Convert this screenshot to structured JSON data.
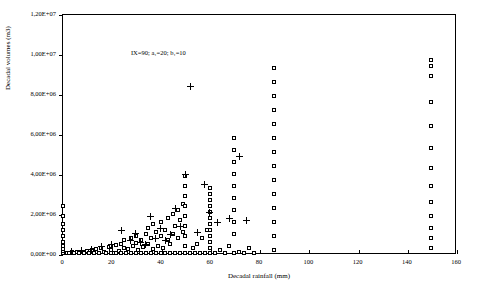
{
  "chart_data": {
    "type": "scatter",
    "title": "",
    "annotation": "IX=90; a₁=20; b₁=10",
    "xlabel": "Decadal rainfall (mm)",
    "ylabel": "Decadal volumes (m3)",
    "xlim": [
      0,
      160
    ],
    "ylim": [
      0,
      12000000
    ],
    "xticks": [
      0,
      20,
      40,
      60,
      80,
      100,
      120,
      140,
      160
    ],
    "xticklabels": [
      "0",
      "20",
      "40",
      "60",
      "80",
      "100",
      "120",
      "140",
      "160"
    ],
    "yticks": [
      0,
      2000000,
      4000000,
      6000000,
      8000000,
      10000000,
      12000000
    ],
    "yticklabels": [
      "0,00E+00",
      "2,00E+06",
      "4,00E+06",
      "6,00E+06",
      "8,00E+06",
      "1,00E+07",
      "1,20E+07"
    ],
    "grid": false,
    "legend": "none",
    "series": [
      {
        "name": "squares",
        "marker": "open-square",
        "points": [
          [
            0.5,
            60000
          ],
          [
            0.5,
            150000
          ],
          [
            0.5,
            250000
          ],
          [
            0.5,
            400000
          ],
          [
            0.5,
            600000
          ],
          [
            0.5,
            900000
          ],
          [
            0.5,
            1200000
          ],
          [
            0.5,
            1500000
          ],
          [
            0.5,
            1900000
          ],
          [
            0.5,
            2400000
          ],
          [
            2,
            60000
          ],
          [
            3,
            60000
          ],
          [
            4,
            80000
          ],
          [
            5,
            60000
          ],
          [
            6,
            100000
          ],
          [
            7,
            60000
          ],
          [
            8,
            120000
          ],
          [
            9,
            60000
          ],
          [
            10,
            150000
          ],
          [
            11,
            60000
          ],
          [
            12,
            200000
          ],
          [
            13,
            60000
          ],
          [
            14,
            240000
          ],
          [
            15,
            60000
          ],
          [
            16,
            300000
          ],
          [
            17,
            100000
          ],
          [
            18,
            60000
          ],
          [
            19,
            350000
          ],
          [
            20,
            60000
          ],
          [
            20,
            200000
          ],
          [
            20,
            400000
          ],
          [
            21,
            60000
          ],
          [
            22,
            450000
          ],
          [
            22,
            60000
          ],
          [
            23,
            150000
          ],
          [
            24,
            500000
          ],
          [
            24,
            60000
          ],
          [
            25,
            300000
          ],
          [
            25,
            700000
          ],
          [
            26,
            60000
          ],
          [
            27,
            250000
          ],
          [
            28,
            60000
          ],
          [
            28,
            800000
          ],
          [
            29,
            400000
          ],
          [
            30,
            60000
          ],
          [
            30,
            550000
          ],
          [
            30,
            900000
          ],
          [
            31,
            200000
          ],
          [
            32,
            60000
          ],
          [
            32,
            700000
          ],
          [
            33,
            350000
          ],
          [
            34,
            60000
          ],
          [
            34,
            1000000
          ],
          [
            35,
            500000
          ],
          [
            35,
            1300000
          ],
          [
            36,
            60000
          ],
          [
            36,
            800000
          ],
          [
            37,
            250000
          ],
          [
            37,
            1500000
          ],
          [
            38,
            60000
          ],
          [
            38,
            1100000
          ],
          [
            39,
            400000
          ],
          [
            40,
            60000
          ],
          [
            40,
            900000
          ],
          [
            40,
            1600000
          ],
          [
            41,
            300000
          ],
          [
            42,
            60000
          ],
          [
            42,
            1200000
          ],
          [
            43,
            700000
          ],
          [
            43,
            1800000
          ],
          [
            44,
            60000
          ],
          [
            44,
            500000
          ],
          [
            45,
            1000000
          ],
          [
            45,
            2000000
          ],
          [
            46,
            60000
          ],
          [
            46,
            1400000
          ],
          [
            47,
            800000
          ],
          [
            47,
            2200000
          ],
          [
            48,
            60000
          ],
          [
            48,
            1700000
          ],
          [
            49,
            1100000
          ],
          [
            49,
            2500000
          ],
          [
            50,
            60000
          ],
          [
            50,
            400000
          ],
          [
            50,
            900000
          ],
          [
            50,
            1400000
          ],
          [
            50,
            1900000
          ],
          [
            50,
            2400000
          ],
          [
            50,
            2900000
          ],
          [
            50,
            3400000
          ],
          [
            50,
            3900000
          ],
          [
            52,
            60000
          ],
          [
            53,
            300000
          ],
          [
            54,
            60000
          ],
          [
            55,
            500000
          ],
          [
            56,
            60000
          ],
          [
            57,
            800000
          ],
          [
            58,
            60000
          ],
          [
            59,
            1200000
          ],
          [
            60,
            60000
          ],
          [
            60,
            300000
          ],
          [
            60,
            600000
          ],
          [
            60,
            900000
          ],
          [
            60,
            1200000
          ],
          [
            60,
            1500000
          ],
          [
            60,
            1800000
          ],
          [
            60,
            2100000
          ],
          [
            60,
            2400000
          ],
          [
            60,
            2700000
          ],
          [
            60,
            3000000
          ],
          [
            60,
            3300000
          ],
          [
            62,
            60000
          ],
          [
            64,
            200000
          ],
          [
            66,
            60000
          ],
          [
            68,
            400000
          ],
          [
            70,
            60000
          ],
          [
            70,
            1000000
          ],
          [
            70,
            1600000
          ],
          [
            70,
            2200000
          ],
          [
            70,
            2800000
          ],
          [
            70,
            3400000
          ],
          [
            70,
            4000000
          ],
          [
            70,
            4600000
          ],
          [
            70,
            5200000
          ],
          [
            70,
            5800000
          ],
          [
            72,
            100000
          ],
          [
            74,
            60000
          ],
          [
            76,
            300000
          ],
          [
            78,
            60000
          ],
          [
            86,
            200000
          ],
          [
            86,
            900000
          ],
          [
            86,
            1600000
          ],
          [
            86,
            2300000
          ],
          [
            86,
            3000000
          ],
          [
            86,
            3700000
          ],
          [
            86,
            4400000
          ],
          [
            86,
            5100000
          ],
          [
            86,
            5800000
          ],
          [
            86,
            6500000
          ],
          [
            86,
            7200000
          ],
          [
            86,
            7900000
          ],
          [
            86,
            8600000
          ],
          [
            86,
            9300000
          ],
          [
            150,
            300000
          ],
          [
            150,
            800000
          ],
          [
            150,
            1300000
          ],
          [
            150,
            1900000
          ],
          [
            150,
            2600000
          ],
          [
            150,
            3400000
          ],
          [
            150,
            4300000
          ],
          [
            150,
            5300000
          ],
          [
            150,
            6400000
          ],
          [
            150,
            7600000
          ],
          [
            150,
            8900000
          ],
          [
            150,
            9400000
          ],
          [
            150,
            9700000
          ]
        ]
      },
      {
        "name": "crosses",
        "marker": "plus",
        "points": [
          [
            4,
            120000
          ],
          [
            8,
            180000
          ],
          [
            12,
            250000
          ],
          [
            16,
            400000
          ],
          [
            20,
            500000
          ],
          [
            24,
            1200000
          ],
          [
            28,
            700000
          ],
          [
            30,
            1050000
          ],
          [
            32,
            600000
          ],
          [
            34,
            500000
          ],
          [
            36,
            1900000
          ],
          [
            38,
            800000
          ],
          [
            40,
            1300000
          ],
          [
            42,
            700000
          ],
          [
            44,
            1000000
          ],
          [
            46,
            2300000
          ],
          [
            48,
            1400000
          ],
          [
            50,
            4000000
          ],
          [
            52,
            8400000
          ],
          [
            55,
            1100000
          ],
          [
            58,
            3500000
          ],
          [
            60,
            2100000
          ],
          [
            63,
            1600000
          ],
          [
            68,
            1800000
          ],
          [
            72,
            4900000
          ],
          [
            75,
            1700000
          ]
        ]
      }
    ]
  }
}
